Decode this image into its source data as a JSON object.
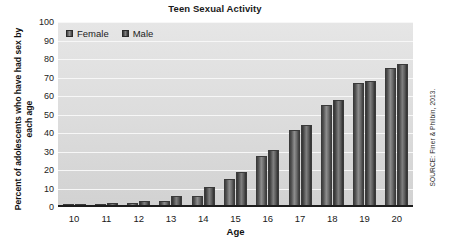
{
  "chart_data": {
    "type": "bar",
    "title": "Teen Sexual Activity",
    "xlabel": "Age",
    "ylabel": "Percent of adolescents who have had sex by each age",
    "categories": [
      "10",
      "11",
      "12",
      "13",
      "14",
      "15",
      "16",
      "17",
      "18",
      "19",
      "20"
    ],
    "series": [
      {
        "name": "Female",
        "values": [
          0.6,
          0.8,
          1,
          2,
          5,
          14,
          26.5,
          40.5,
          54,
          66,
          74
        ]
      },
      {
        "name": "Male",
        "values": [
          0.7,
          0.9,
          2,
          5,
          10,
          18,
          29.5,
          43,
          57,
          67,
          76
        ]
      }
    ],
    "ylim": [
      0,
      100
    ],
    "ytick_labels": [
      "100",
      "90",
      "80",
      "70",
      "60",
      "50",
      "40",
      "30",
      "20",
      "10",
      "0"
    ],
    "ytick_values": [
      100,
      90,
      80,
      70,
      60,
      50,
      40,
      30,
      20,
      10,
      0
    ],
    "grid": true,
    "legend_position": "top-left",
    "colors": {
      "female": "#8e8e8e",
      "male": "#707070",
      "plot_background": "#dcdcdc",
      "gridline": "#f7f7f7",
      "axis": "#1d1d1d",
      "text": "#1a1a1a"
    }
  },
  "source": {
    "note": "SOURCE: Finer & Philbin, 2013."
  }
}
